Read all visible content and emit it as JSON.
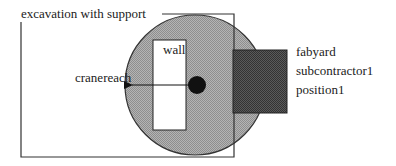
{
  "diagram": {
    "excavation": {
      "label": "excavation with support"
    },
    "crane": {
      "reach_label": "cranereach"
    },
    "wall": {
      "label": "wall"
    },
    "fabyard": {
      "lines": [
        "fabyard",
        "subcontractor1",
        "position1"
      ]
    },
    "colors": {
      "crane_reach_fill": "#a9a9a9",
      "fabyard_fill": "#4a4a4a",
      "wall_fill": "#ffffff",
      "crane_dot": "#111111",
      "stroke": "#333333"
    }
  }
}
